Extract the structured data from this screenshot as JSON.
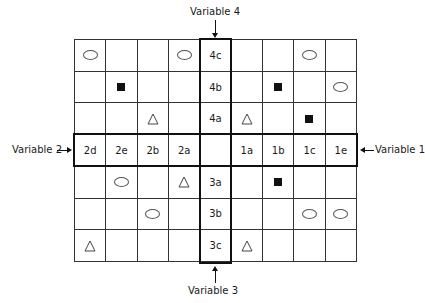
{
  "labels": {
    "variable_1": "Variable 1",
    "variable_2": "Variable 2",
    "variable_3": "Variable 3",
    "variable_4": "Variable 4"
  },
  "grid": {
    "rows": 7,
    "cols": 9,
    "cells": [
      [
        "oval",
        "",
        "",
        "oval",
        "4c",
        "",
        "",
        "oval",
        ""
      ],
      [
        "",
        "square",
        "",
        "",
        "4b",
        "",
        "square",
        "",
        "oval"
      ],
      [
        "",
        "",
        "triangle",
        "",
        "4a",
        "triangle",
        "",
        "square",
        ""
      ],
      [
        "2d",
        "2e",
        "2b",
        "2a",
        "",
        "1a",
        "1b",
        "1c",
        "1e"
      ],
      [
        "",
        "oval",
        "",
        "triangle",
        "3a",
        "",
        "square",
        "",
        ""
      ],
      [
        "",
        "",
        "oval",
        "",
        "3b",
        "",
        "",
        "oval",
        "oval"
      ],
      [
        "triangle",
        "",
        "",
        "",
        "3c",
        "triangle",
        "",
        "",
        ""
      ]
    ]
  },
  "symbols": {
    "oval": "oval-icon",
    "square": "filled-square-icon",
    "triangle": "triangle-icon"
  }
}
